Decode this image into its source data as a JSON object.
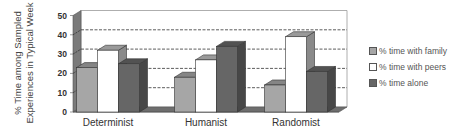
{
  "chart_data": {
    "type": "bar",
    "style": "3d-clustered-column",
    "title": "",
    "xlabel": "",
    "ylabel": "% Time among Sampled Experiences in Typical Week",
    "ylabel_lines": [
      "% Time among Sampled",
      "Experiences in Typical Week"
    ],
    "ylim": [
      0,
      50
    ],
    "yticks": [
      "0",
      "10",
      "20",
      "30",
      "40",
      "50"
    ],
    "grid": true,
    "legend_position": "right",
    "categories": [
      "Determinist",
      "Humanist",
      "Randomist"
    ],
    "series": [
      {
        "name": "% time with family",
        "color": "#a6a6a6",
        "values": [
          23,
          18,
          14
        ]
      },
      {
        "name": "% time with peers",
        "color": "#ffffff",
        "values": [
          32,
          27,
          39
        ]
      },
      {
        "name": "% time alone",
        "color": "#666666",
        "values": [
          25,
          34,
          21
        ]
      }
    ]
  }
}
